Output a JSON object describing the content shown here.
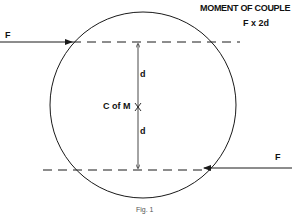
{
  "diagram": {
    "title": "MOMENT OF COUPLE",
    "formula": "F x 2d",
    "force_left_label": "F",
    "force_right_label": "F",
    "distance_upper_label": "d",
    "distance_lower_label": "d",
    "center_label": "C of M",
    "caption": "Fig. 1",
    "line_color": "#1a1a1a"
  }
}
